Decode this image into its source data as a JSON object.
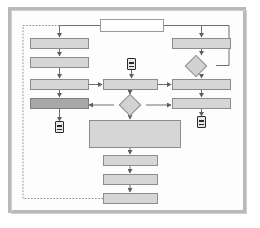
{
  "diagram": {
    "type": "flowchart",
    "frame": {
      "outer_border_color": "#b9b9b9",
      "inner_border_color": "#cfcfcf",
      "background_color": "#fdfdfd"
    },
    "style": {
      "node_fill": "#d2d2d2",
      "node_fill_light": "#d6d6d6",
      "node_fill_dark": "#a8a8a8",
      "node_fill_white": "#ffffff",
      "node_stroke": "#8d8d8d",
      "connector_stroke": "#6e6e6e",
      "dashed_loop_stroke": "#8a8a8a",
      "marker_stroke": "#2b2b2b"
    },
    "nodes": [
      {
        "id": "start",
        "label": "",
        "shape": "process",
        "fill": "white",
        "x": 100,
        "y": 19,
        "w": 64,
        "h": 13
      },
      {
        "id": "l1",
        "label": "",
        "shape": "process",
        "fill": "light",
        "x": 30,
        "y": 38,
        "w": 59,
        "h": 11
      },
      {
        "id": "l2",
        "label": "",
        "shape": "process",
        "fill": "light",
        "x": 30,
        "y": 57,
        "w": 59,
        "h": 11
      },
      {
        "id": "l3",
        "label": "",
        "shape": "process",
        "fill": "light",
        "x": 30,
        "y": 79,
        "w": 59,
        "h": 11
      },
      {
        "id": "l4",
        "label": "",
        "shape": "process",
        "fill": "dark",
        "x": 30,
        "y": 98,
        "w": 59,
        "h": 11
      },
      {
        "id": "c1",
        "label": "",
        "shape": "process",
        "fill": "light",
        "x": 103,
        "y": 79,
        "w": 55,
        "h": 11
      },
      {
        "id": "r1",
        "label": "",
        "shape": "process",
        "fill": "light",
        "x": 172,
        "y": 38,
        "w": 59,
        "h": 11
      },
      {
        "id": "r2",
        "label": "",
        "shape": "process",
        "fill": "light",
        "x": 172,
        "y": 79,
        "w": 59,
        "h": 11
      },
      {
        "id": "r3",
        "label": "",
        "shape": "process",
        "fill": "light",
        "x": 172,
        "y": 98,
        "w": 59,
        "h": 11
      },
      {
        "id": "big",
        "label": "",
        "shape": "process",
        "fill": "light",
        "x": 89,
        "y": 120,
        "w": 92,
        "h": 28
      },
      {
        "id": "b1",
        "label": "",
        "shape": "process",
        "fill": "light",
        "x": 103,
        "y": 155,
        "w": 55,
        "h": 11
      },
      {
        "id": "b2",
        "label": "",
        "shape": "process",
        "fill": "light",
        "x": 103,
        "y": 174,
        "w": 55,
        "h": 11
      },
      {
        "id": "b3",
        "label": "",
        "shape": "process",
        "fill": "light",
        "x": 103,
        "y": 193,
        "w": 55,
        "h": 11
      }
    ],
    "decisions": [
      {
        "id": "d-right",
        "label": "",
        "x": 186,
        "y": 56,
        "w": 30,
        "h": 19
      },
      {
        "id": "d-center",
        "label": "",
        "x": 114,
        "y": 95,
        "w": 32,
        "h": 20
      }
    ],
    "markers": [
      {
        "id": "marker-center-top",
        "name": "off-page-connector",
        "x": 127,
        "y": 58
      },
      {
        "id": "marker-left-bottom",
        "name": "off-page-connector",
        "x": 58,
        "y": 122
      },
      {
        "id": "marker-right",
        "name": "off-page-connector",
        "x": 196,
        "y": 117
      }
    ],
    "loop": {
      "style": "dashed",
      "description": "feedback loop from last bottom node around the left side back to the top entry"
    },
    "counts": {
      "process_nodes": 13,
      "decision_nodes": 2,
      "connector_markers": 3
    }
  }
}
